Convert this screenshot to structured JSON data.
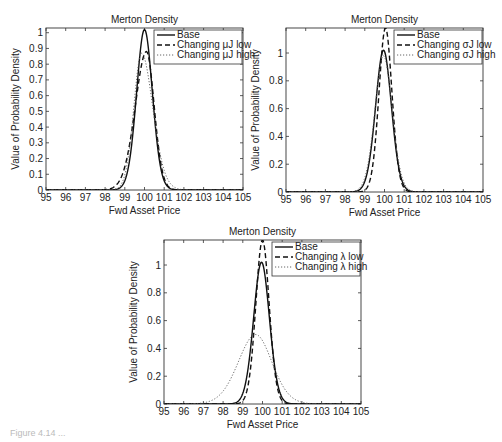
{
  "chart_data": [
    {
      "type": "line",
      "title": "Merton Density",
      "xlabel": "Fwd Asset Price",
      "ylabel": "Value of Probability Density",
      "xlim": [
        95,
        105
      ],
      "ylim": [
        0,
        1.03
      ],
      "xticks": [
        95,
        96,
        97,
        98,
        99,
        100,
        101,
        102,
        103,
        104,
        105
      ],
      "yticks": [
        0,
        0.1,
        0.2,
        0.3,
        0.4,
        0.5,
        0.6,
        0.7,
        0.8,
        0.9,
        1
      ],
      "legend_position": "upper right",
      "series": [
        {
          "name": "Base",
          "style": "solid",
          "peak_x": 100.0,
          "peak_y": 1.02,
          "sd_left": 0.39,
          "sd_right": 0.39
        },
        {
          "name": "Changing μJ low",
          "style": "dashed",
          "peak_x": 100.1,
          "peak_y": 0.88,
          "sd_left": 0.55,
          "sd_right": 0.38
        },
        {
          "name": "Changing μJ high",
          "style": "dotted",
          "peak_x": 99.85,
          "peak_y": 0.87,
          "sd_left": 0.38,
          "sd_right": 0.55
        }
      ]
    },
    {
      "type": "line",
      "title": "Merton Density",
      "xlabel": "Fwd Asset Price",
      "ylabel": "Value of Probability Density",
      "xlim": [
        95,
        105
      ],
      "ylim": [
        0,
        1.18
      ],
      "xticks": [
        95,
        96,
        97,
        98,
        99,
        100,
        101,
        102,
        103,
        104,
        105
      ],
      "yticks": [
        0,
        0.2,
        0.4,
        0.6,
        0.8,
        1
      ],
      "legend_position": "upper right",
      "series": [
        {
          "name": "Base",
          "style": "solid",
          "peak_x": 99.95,
          "peak_y": 1.02,
          "sd_left": 0.39,
          "sd_right": 0.39
        },
        {
          "name": "Changing σJ low",
          "style": "dashed",
          "peak_x": 100.05,
          "peak_y": 1.18,
          "sd_left": 0.32,
          "sd_right": 0.32
        },
        {
          "name": "Changing σJ high",
          "style": "dotted",
          "peak_x": 99.95,
          "peak_y": 0.98,
          "sd_left": 0.42,
          "sd_right": 0.42
        }
      ]
    },
    {
      "type": "line",
      "title": "Merton Density",
      "xlabel": "Fwd Asset Price",
      "ylabel": "Value of Probability Density",
      "xlim": [
        95,
        105
      ],
      "ylim": [
        0,
        1.18
      ],
      "xticks": [
        95,
        96,
        97,
        98,
        99,
        100,
        101,
        102,
        103,
        104,
        105
      ],
      "yticks": [
        0,
        0.2,
        0.4,
        0.6,
        0.8,
        1
      ],
      "legend_position": "upper right",
      "series": [
        {
          "name": "Base",
          "style": "solid",
          "peak_x": 99.95,
          "peak_y": 1.02,
          "sd_left": 0.39,
          "sd_right": 0.39
        },
        {
          "name": "Changing λ low",
          "style": "dashed",
          "peak_x": 100.0,
          "peak_y": 1.18,
          "sd_left": 0.33,
          "sd_right": 0.33
        },
        {
          "name": "Changing λ high",
          "style": "dotted",
          "peak_x": 99.65,
          "peak_y": 0.5,
          "sd_left": 0.85,
          "sd_right": 0.8
        }
      ]
    }
  ],
  "layout": {
    "plots": [
      {
        "left": 46,
        "top": 28,
        "right": 243,
        "bottom": 190
      },
      {
        "left": 286,
        "top": 28,
        "right": 483,
        "bottom": 192
      },
      {
        "left": 164,
        "top": 240,
        "right": 361,
        "bottom": 404
      }
    ]
  },
  "caption": "Figure 4.14  ..."
}
